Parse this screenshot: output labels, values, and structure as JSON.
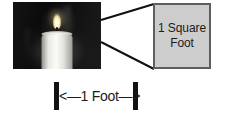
{
  "figure": {
    "name": "candle-one-square-foot-diagram",
    "background_color": "#ffffff",
    "photo": {
      "alt": "black-and-white photograph of a lit white pillar candle",
      "subject": "lit candle",
      "background_color": "#0d0d0d",
      "candle_color": "#fbfbf7",
      "flame_color": "#fff8dd"
    },
    "callout": {
      "line_color": "#111111",
      "line_width": 2,
      "description": "two diverging lines from the photo edge to the box corners"
    },
    "sqft_box": {
      "label": "1 Square\nFoot",
      "label_line1": "1 Square",
      "label_line2": "Foot",
      "fill_color": "#cdcdcd",
      "border_color": "#5e5e5e",
      "text_color": "#1b1b1b"
    },
    "measurement": {
      "label": "<—1 Foot—>",
      "value": "1 Foot",
      "cap_color": "#111111",
      "text_color": "#1b1b1b"
    }
  }
}
